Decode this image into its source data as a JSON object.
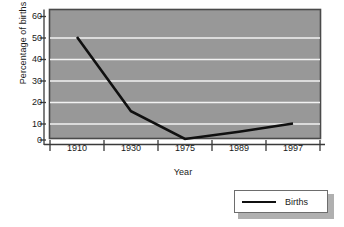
{
  "chart_data": {
    "type": "line",
    "title": "",
    "xlabel": "Year",
    "ylabel": "Percentage of births",
    "categories": [
      "1910",
      "1930",
      "1975",
      "1989",
      "1997"
    ],
    "series": [
      {
        "name": "Births",
        "values": [
          50,
          14,
          0.5,
          4,
          8
        ]
      }
    ],
    "ylim": [
      0,
      60
    ],
    "yticks": [
      0,
      10,
      20,
      30,
      40,
      50,
      60
    ],
    "ytick_labels": [
      "0",
      "10",
      "20",
      "30",
      "40",
      "50",
      "60"
    ],
    "grid": true,
    "grid_axis": "y",
    "legend_position": "bottom-right",
    "legend_entries": [
      "Births"
    ]
  },
  "axes": {
    "y_title": "Percentage of births",
    "x_title": "Year"
  },
  "legend": {
    "series_label": "Births"
  },
  "colors": {
    "plot_background": "#989898",
    "plot_border": "#4a4a4a",
    "gridline": "#f2f2f2",
    "series_line": "#101010",
    "axis_line": "#3a3a3a",
    "text": "#1a1a1a",
    "page_background": "#ffffff",
    "legend_background": "#ffffff",
    "legend_border": "#6d6d6d",
    "legend_shadow": "#b0b0b0"
  }
}
